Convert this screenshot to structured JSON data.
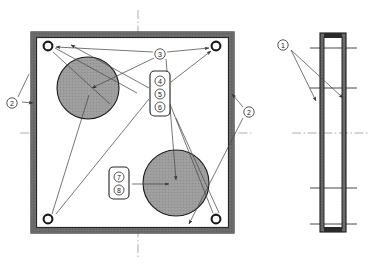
{
  "drawing": {
    "title": "Assembly exploded parts diagram",
    "views": [
      {
        "name": "front-view",
        "label": "front elevation"
      },
      {
        "name": "side-view",
        "label": "side elevation"
      }
    ],
    "colors": {
      "line": "#1a1a1a",
      "frame_fill": "#5a5a5a",
      "disc_fill": "#9a9a9a",
      "leader": "#555555",
      "centerline": "#7a7a7a",
      "background": "#ffffff"
    }
  },
  "balloons": {
    "one": {
      "number": "1",
      "glyph": "1",
      "x": 283,
      "y": 45
    },
    "two_left": {
      "number": "2",
      "glyph": "2",
      "x": 12,
      "y": 103
    },
    "two_right": {
      "number": "2",
      "glyph": "2",
      "x": 249,
      "y": 112
    },
    "three": {
      "number": "3",
      "glyph": "3",
      "x": 160,
      "y": 54
    },
    "four": {
      "number": "4",
      "glyph": "4",
      "x": 160,
      "y": 81
    },
    "five": {
      "number": "5",
      "glyph": "5",
      "x": 160,
      "y": 94
    },
    "six": {
      "number": "6",
      "glyph": "6",
      "x": 160,
      "y": 107
    },
    "seven": {
      "number": "7",
      "glyph": "7",
      "x": 119,
      "y": 177
    },
    "eight": {
      "number": "8",
      "glyph": "8",
      "x": 119,
      "y": 191
    }
  },
  "front_view": {
    "frame": {
      "x": 31,
      "y": 32,
      "width": 203,
      "height": 201,
      "wall": 5
    },
    "discs": [
      {
        "name": "upper-disc",
        "cx": 88,
        "cy": 88,
        "r": 31
      },
      {
        "name": "lower-disc",
        "cx": 176,
        "cy": 183,
        "r": 33
      }
    ],
    "holes": [
      {
        "name": "hole-top-left",
        "cx": 48,
        "cy": 46,
        "r": 5
      },
      {
        "name": "hole-top-right",
        "cx": 216,
        "cy": 46,
        "r": 5
      },
      {
        "name": "hole-bottom-left",
        "cx": 48,
        "cy": 219,
        "r": 5
      },
      {
        "name": "hole-bottom-right",
        "cx": 216,
        "cy": 219,
        "r": 5
      }
    ],
    "centerlines": {
      "vertical_x": 138,
      "horizontal_y": 133
    }
  },
  "side_view": {
    "profile": {
      "x": 320,
      "y": 33,
      "width": 26,
      "height": 199,
      "wall": 4
    },
    "tick_lines_y": [
      48,
      88,
      188,
      224
    ],
    "centerline_y": 133
  }
}
